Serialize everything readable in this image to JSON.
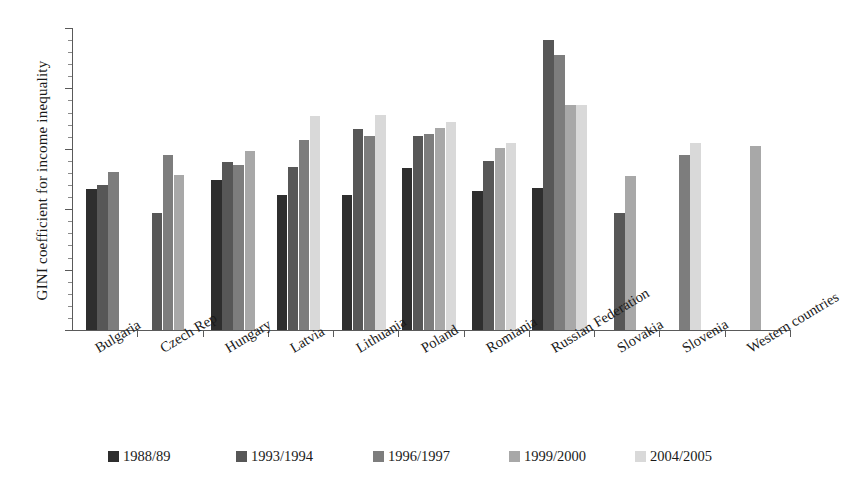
{
  "chart_data": {
    "type": "bar",
    "title": "",
    "xlabel": "",
    "ylabel": "GINI coefficient for income inequality",
    "ylim": [
      0,
      50
    ],
    "ytick_labels": [
      "0",
      "10",
      "20",
      "30",
      "40",
      "50"
    ],
    "ytick_values": [
      0,
      10,
      20,
      30,
      40,
      50
    ],
    "grid": false,
    "legend_position": "bottom",
    "categories": [
      "Bulgaria",
      "Czech Rep",
      "Hungary",
      "Latvia",
      "Lithuania",
      "Poland",
      "Romiania",
      "Russian Federation",
      "Slovakia",
      "Slovenia",
      "Western countries"
    ],
    "series": [
      {
        "name": "1988/89",
        "color": "#2e2e2e",
        "values": [
          23.3,
          null,
          24.8,
          22.3,
          22.3,
          26.8,
          23.0,
          23.5,
          null,
          null,
          null
        ]
      },
      {
        "name": "1993/1994",
        "color": "#575757",
        "values": [
          24.0,
          19.3,
          27.8,
          27.0,
          33.3,
          32.1,
          27.9,
          48.0,
          19.3,
          null,
          null
        ]
      },
      {
        "name": "1996/1997",
        "color": "#7d7d7d",
        "values": [
          26.2,
          28.9,
          27.4,
          31.5,
          32.2,
          32.4,
          null,
          45.6,
          null,
          28.9,
          null
        ]
      },
      {
        "name": "1999/2000",
        "color": "#a8a8a8",
        "values": [
          null,
          25.6,
          29.7,
          null,
          null,
          33.4,
          30.2,
          37.2,
          25.5,
          null,
          30.5
        ]
      },
      {
        "name": "2004/2005",
        "color": "#d9d9d9",
        "values": [
          null,
          null,
          null,
          35.5,
          35.6,
          34.5,
          31.0,
          37.2,
          null,
          30.9,
          null
        ]
      }
    ]
  }
}
